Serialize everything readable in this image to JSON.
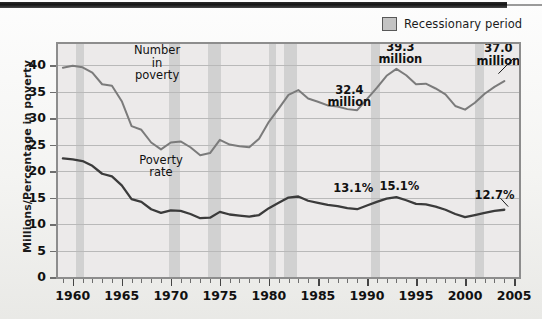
{
  "legend": {
    "swatch_name": "recession-swatch",
    "label": "Recessionary period",
    "swatch_color": "#c3c3c3"
  },
  "axes": {
    "ylabel": "Millions/Percentage in poverty",
    "yticks": [
      0,
      5,
      10,
      15,
      20,
      25,
      30,
      35,
      40
    ],
    "ylim": [
      0,
      44
    ],
    "xticks": [
      1960,
      1965,
      1970,
      1975,
      1980,
      1985,
      1990,
      1995,
      2000,
      2005
    ],
    "xlim": [
      1958.5,
      2005.5
    ],
    "xminor_step": 1
  },
  "series_labels": {
    "number_in_poverty": "Number\nin\npoverty",
    "poverty_rate": "Poverty rate"
  },
  "annotations": [
    {
      "name": "annot-32-4-million",
      "text": "32.4\nmillion",
      "x": 1988.2,
      "y": 35.2
    },
    {
      "name": "annot-39-3-million",
      "text": "39.3\nmillion",
      "x": 1993.4,
      "y": 43.3
    },
    {
      "name": "annot-37-0-million",
      "text": "37.0\nmillion",
      "x": 2003.4,
      "y": 43.0
    },
    {
      "name": "annot-13-1-percent",
      "text": "13.1%",
      "x": 1988.6,
      "y": 16.7
    },
    {
      "name": "annot-15-1-percent",
      "text": "15.1%",
      "x": 1993.3,
      "y": 17.0
    },
    {
      "name": "annot-12-7-percent",
      "text": "12.7%",
      "x": 2003.0,
      "y": 15.3
    }
  ],
  "colors": {
    "plot_background": "#eceaea",
    "band": "#cdcdcd",
    "grid": "#b9b9b9",
    "number_line": "#7b7b7b",
    "rate_line": "#3b3b3b",
    "border": "#8d8d8d"
  },
  "chart_data": {
    "type": "line",
    "title": "",
    "xlabel": "",
    "ylabel": "Millions/Percentage in poverty",
    "xlim": [
      1958.5,
      2005.5
    ],
    "ylim": [
      0,
      44
    ],
    "grid": true,
    "legend_position": "top-right",
    "x": [
      1959,
      1960,
      1961,
      1962,
      1963,
      1964,
      1965,
      1966,
      1967,
      1968,
      1969,
      1970,
      1971,
      1972,
      1973,
      1974,
      1975,
      1976,
      1977,
      1978,
      1979,
      1980,
      1981,
      1982,
      1983,
      1984,
      1985,
      1986,
      1987,
      1988,
      1989,
      1990,
      1991,
      1992,
      1993,
      1994,
      1995,
      1996,
      1997,
      1998,
      1999,
      2000,
      2001,
      2002,
      2003,
      2004
    ],
    "series": [
      {
        "name": "Number in poverty",
        "unit": "millions",
        "color": "#7b7b7b",
        "values": [
          39.5,
          39.9,
          39.6,
          38.6,
          36.4,
          36.1,
          33.2,
          28.5,
          27.8,
          25.4,
          24.1,
          25.4,
          25.6,
          24.5,
          23.0,
          23.4,
          25.9,
          25.0,
          24.7,
          24.5,
          26.1,
          29.3,
          31.8,
          34.4,
          35.3,
          33.7,
          33.1,
          32.4,
          32.2,
          31.7,
          31.5,
          33.6,
          35.7,
          38.0,
          39.3,
          38.1,
          36.4,
          36.5,
          35.6,
          34.5,
          32.3,
          31.6,
          32.9,
          34.6,
          35.9,
          37.0
        ]
      },
      {
        "name": "Poverty rate",
        "unit": "percent",
        "color": "#3b3b3b",
        "values": [
          22.4,
          22.2,
          21.9,
          21.0,
          19.5,
          19.0,
          17.3,
          14.7,
          14.2,
          12.8,
          12.1,
          12.6,
          12.5,
          11.9,
          11.1,
          11.2,
          12.3,
          11.8,
          11.6,
          11.4,
          11.7,
          13.0,
          14.0,
          15.0,
          15.2,
          14.4,
          14.0,
          13.6,
          13.4,
          13.0,
          12.8,
          13.5,
          14.2,
          14.8,
          15.1,
          14.5,
          13.8,
          13.7,
          13.3,
          12.7,
          11.9,
          11.3,
          11.7,
          12.1,
          12.5,
          12.7
        ]
      }
    ],
    "recession_bands": [
      {
        "start": 1960.3,
        "end": 1961.2
      },
      {
        "start": 1969.8,
        "end": 1970.9
      },
      {
        "start": 1973.8,
        "end": 1975.1
      },
      {
        "start": 1980.0,
        "end": 1980.7
      },
      {
        "start": 1981.5,
        "end": 1982.9
      },
      {
        "start": 1990.4,
        "end": 1991.3
      },
      {
        "start": 2001.0,
        "end": 2001.9
      }
    ],
    "data_labels": [
      {
        "label": "32.4 million",
        "x": 1987,
        "value": 32.4
      },
      {
        "label": "39.3 million",
        "x": 1993,
        "value": 39.3
      },
      {
        "label": "37.0 million",
        "x": 2004,
        "value": 37.0
      },
      {
        "label": "13.1%",
        "x": 1989,
        "value": 13.0
      },
      {
        "label": "15.1%",
        "x": 1993,
        "value": 15.1
      },
      {
        "label": "12.7%",
        "x": 2004,
        "value": 12.7
      }
    ]
  }
}
